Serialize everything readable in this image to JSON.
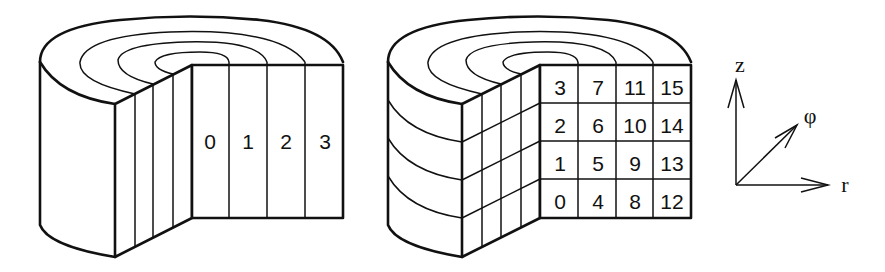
{
  "diagrams": {
    "left": {
      "title": "radial decomposition",
      "cell_labels": [
        "0",
        "1",
        "2",
        "3"
      ]
    },
    "right": {
      "title": "radial-axial decomposition",
      "grid_rows_top_to_bottom": [
        [
          "3",
          "7",
          "11",
          "15"
        ],
        [
          "2",
          "6",
          "10",
          "14"
        ],
        [
          "1",
          "5",
          "9",
          "13"
        ],
        [
          "0",
          "4",
          "8",
          "12"
        ]
      ]
    },
    "axes": {
      "z_label": "z",
      "phi_label": "φ",
      "r_label": "r"
    }
  }
}
